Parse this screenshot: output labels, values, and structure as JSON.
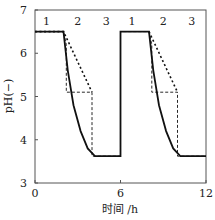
{
  "chart_data": {
    "type": "line",
    "title": "",
    "xlabel": "时间 /h",
    "ylabel": "pH(−)",
    "xlim": [
      0,
      12
    ],
    "ylim": [
      3,
      7
    ],
    "xticks": [
      "0",
      "6",
      "12"
    ],
    "yticks": [
      "3",
      "4",
      "5",
      "6",
      "7"
    ],
    "grid": false,
    "legend": null,
    "annotations": [
      "1",
      "2",
      "3",
      "1",
      "2",
      "3"
    ],
    "annotation_x": [
      0.8,
      3.0,
      5.0,
      6.8,
      9.0,
      11.0
    ],
    "series": [
      {
        "name": "solid",
        "style": "solid",
        "x": [
          0,
          2.0,
          2.3,
          2.7,
          3.2,
          3.7,
          4.2,
          6.0,
          6.0,
          8.0,
          8.3,
          8.7,
          9.2,
          9.7,
          10.2,
          12.0
        ],
        "y": [
          6.5,
          6.5,
          5.6,
          4.8,
          4.2,
          3.8,
          3.62,
          3.62,
          6.5,
          6.5,
          5.6,
          4.8,
          4.2,
          3.8,
          3.62,
          3.62
        ]
      },
      {
        "name": "dashed",
        "style": "dashed",
        "x": [
          0,
          2.0,
          2.2,
          2.2,
          4.0,
          4.0,
          6.0,
          6.0,
          8.0,
          8.2,
          8.2,
          10.0,
          10.0,
          12.0
        ],
        "y": [
          6.5,
          6.5,
          6.2,
          5.1,
          5.1,
          3.62,
          3.62,
          6.5,
          6.5,
          6.2,
          5.1,
          5.1,
          3.62,
          3.62
        ]
      },
      {
        "name": "dotted",
        "style": "dotted",
        "x": [
          0,
          2.0,
          4.0,
          6.0,
          8.0,
          10.0
        ],
        "y": [
          6.5,
          6.5,
          5.1,
          null,
          6.5,
          5.1
        ]
      }
    ]
  }
}
